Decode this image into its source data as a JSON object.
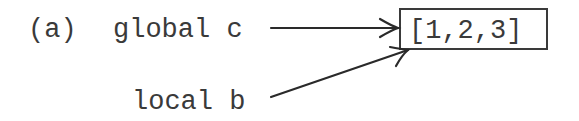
{
  "figure": {
    "label": "(a)",
    "variables": [
      {
        "name": "global c",
        "scope": "global",
        "identifier": "c"
      },
      {
        "name": "local b",
        "scope": "local",
        "identifier": "b"
      }
    ],
    "object": {
      "value": "[1,2,3]"
    },
    "arrows": [
      {
        "from": "global c",
        "to": "[1,2,3]"
      },
      {
        "from": "local b",
        "to": "[1,2,3]"
      }
    ],
    "colors": {
      "ink": "#3a3a3a",
      "background": "#ffffff"
    }
  }
}
